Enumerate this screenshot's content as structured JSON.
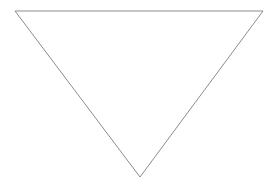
{
  "canvas": {
    "width": 274,
    "height": 188,
    "background_color": "#ffffff",
    "label": "blank-white-canvas"
  },
  "figure": {
    "kind": "triangle",
    "orientation": "point-down",
    "stroke_color": "#8c8c8c",
    "stroke_width": 1,
    "fill": "none",
    "points": "15,11 263,11 140,177",
    "vertices": [
      {
        "name": "top-left",
        "x": 15,
        "y": 11
      },
      {
        "name": "top-right",
        "x": 263,
        "y": 11
      },
      {
        "name": "bottom-apex",
        "x": 140,
        "y": 177
      }
    ],
    "edges": [
      {
        "name": "top-edge",
        "from": "top-left",
        "to": "top-right"
      },
      {
        "name": "right-edge",
        "from": "top-right",
        "to": "bottom-apex"
      },
      {
        "name": "left-edge",
        "from": "bottom-apex",
        "to": "top-left"
      }
    ]
  },
  "text": {
    "labels": []
  }
}
